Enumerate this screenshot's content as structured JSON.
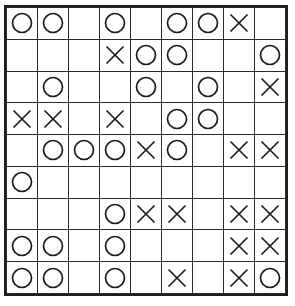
{
  "puzzle": {
    "title": "Tic-Tac-Toe Style Grid Puzzle",
    "type": "grid",
    "rows": 9,
    "columns": 9,
    "symbols": {
      "circle": "O",
      "cross": "X",
      "empty": ""
    },
    "colors": {
      "background": "#ffffff",
      "grid_line": "#2b2b2b",
      "border": "#1d1d1d",
      "mark": "#1d1d1d"
    },
    "cells": [
      [
        "O",
        "O",
        "",
        "O",
        "",
        "O",
        "O",
        "X",
        ""
      ],
      [
        "",
        "",
        "",
        "X",
        "O",
        "O",
        "",
        "",
        "O"
      ],
      [
        "",
        "O",
        "",
        "",
        "O",
        "",
        "O",
        "",
        "X"
      ],
      [
        "X",
        "X",
        "",
        "X",
        "",
        "O",
        "O",
        "",
        ""
      ],
      [
        "",
        "O",
        "O",
        "O",
        "X",
        "O",
        "",
        "X",
        "X"
      ],
      [
        "O",
        "",
        "",
        "",
        "",
        "",
        "",
        "",
        ""
      ],
      [
        "",
        "",
        "",
        "O",
        "X",
        "X",
        "",
        "X",
        "X"
      ],
      [
        "O",
        "O",
        "",
        "O",
        "",
        "",
        "",
        "X",
        "X"
      ],
      [
        "O",
        "O",
        "",
        "O",
        "",
        "X",
        "",
        "X",
        "O"
      ]
    ],
    "counts": {
      "circles": 29,
      "crosses": 20,
      "empty": 32,
      "total": 81
    }
  }
}
